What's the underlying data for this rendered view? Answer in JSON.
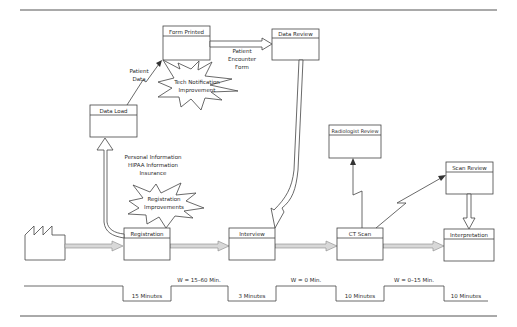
{
  "diagram": {
    "processes": [
      {
        "id": "registration",
        "label": "Registration"
      },
      {
        "id": "interview",
        "label": "Interview"
      },
      {
        "id": "ct_scan",
        "label": "CT Scan"
      },
      {
        "id": "interpretation",
        "label": "Interpretation"
      }
    ],
    "info_boxes": [
      {
        "id": "data_load",
        "label": "Data Load"
      },
      {
        "id": "form_printed",
        "label": "Form Printed"
      },
      {
        "id": "data_review",
        "label": "Data Review"
      },
      {
        "id": "radiologist_review",
        "label": "Radiologist Review"
      },
      {
        "id": "scan_review",
        "label": "Scan Review"
      }
    ],
    "flow_labels": {
      "patient_data": [
        "Patient",
        "Data"
      ],
      "patient_encounter_form": [
        "Patient",
        "Encounter",
        "Form"
      ],
      "registration_info": [
        "Personal Information",
        "HIPAA Information",
        "Insurance"
      ]
    },
    "kaizen_bursts": [
      {
        "id": "tech_notification",
        "lines": [
          "Tech Notification",
          "Improvement"
        ]
      },
      {
        "id": "registration_improvements",
        "lines": [
          "Registration",
          "Improvements"
        ]
      }
    ],
    "timeline": {
      "process_times": [
        "15 Minutes",
        "3 Minutes",
        "10 Minutes",
        "10 Minutes"
      ],
      "wait_times": [
        "W = 15–60 Min.",
        "W = 0 Min.",
        "W = 0–15 Min."
      ]
    },
    "icons": {
      "supplier": "factory-icon",
      "push_arrow": "push-arrow-icon",
      "electronic_flow": "lightning-arrow-icon",
      "manual_flow": "hollow-arrow-icon",
      "kaizen": "starburst-icon"
    }
  }
}
